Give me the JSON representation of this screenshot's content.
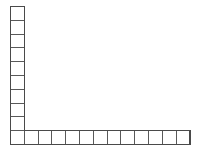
{
  "figure": {
    "name": "L-shaped-polyomino-grid",
    "background_color": "#ffffff",
    "line_color": "#595959",
    "outline_color": "#4a4a4a",
    "cell_size": 13.8,
    "origin_x": 10,
    "origin_y": 6,
    "vertical_arm": {
      "label": "vertical-column",
      "cell_count": 9,
      "orientation": "vertical"
    },
    "horizontal_arm": {
      "label": "horizontal-row",
      "cell_count": 13,
      "orientation": "horizontal"
    },
    "corner_cell": {
      "label": "corner-square",
      "column_index": 0,
      "row_index": 9
    },
    "total_cells": 21
  },
  "chart_data": {
    "type": "diagram",
    "title": "",
    "shape": "L-polyomino",
    "unit_squares_vertical": 9,
    "unit_squares_horizontal": 13,
    "shared_corner_squares": 1,
    "total_unit_squares": 21
  }
}
